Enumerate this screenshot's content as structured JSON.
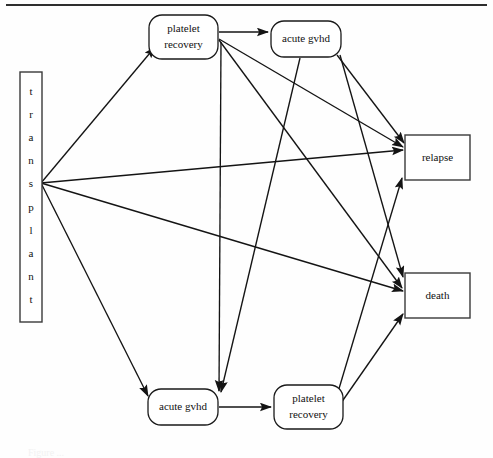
{
  "figure": {
    "type": "multistate-model-diagram",
    "top_rule": true,
    "caption_partial": "Figure ..."
  },
  "nodes": [
    {
      "id": "transplant",
      "label": "transplant",
      "letters": [
        "t",
        "r",
        "a",
        "n",
        "s",
        "p",
        "l",
        "a",
        "n",
        "t"
      ],
      "shape": "vertical-rectangle",
      "x": 20,
      "y": 72,
      "w": 22,
      "h": 250
    },
    {
      "id": "platelet-recovery-top",
      "label": "platelet recovery",
      "line1": "platelet",
      "line2": "recovery",
      "shape": "rounded-rectangle",
      "x": 149,
      "y": 15,
      "w": 69,
      "h": 44
    },
    {
      "id": "acute-gvhd-top",
      "label": "acute gvhd",
      "line1": "acute gvhd",
      "line2": "",
      "shape": "rounded-rectangle",
      "x": 271,
      "y": 21,
      "w": 70,
      "h": 36
    },
    {
      "id": "relapse",
      "label": "relapse",
      "line1": "relapse",
      "line2": "",
      "shape": "rectangle",
      "x": 405,
      "y": 135,
      "w": 65,
      "h": 45
    },
    {
      "id": "death",
      "label": "death",
      "line1": "death",
      "line2": "",
      "shape": "rectangle",
      "x": 405,
      "y": 273,
      "w": 65,
      "h": 45
    },
    {
      "id": "acute-gvhd-bottom",
      "label": "acute gvhd",
      "line1": "acute gvhd",
      "line2": "",
      "shape": "rounded-rectangle",
      "x": 148,
      "y": 389,
      "w": 70,
      "h": 36
    },
    {
      "id": "platelet-recovery-bottom",
      "label": "platelet recovery",
      "line1": "platelet",
      "line2": "recovery",
      "shape": "rounded-rectangle",
      "x": 274,
      "y": 385,
      "w": 69,
      "h": 44
    }
  ],
  "edges": [
    {
      "from": "transplant",
      "to": "platelet-recovery-top",
      "path": "M41,183 L155,47"
    },
    {
      "from": "transplant",
      "to": "relapse",
      "path": "M41,183 L403,150"
    },
    {
      "from": "transplant",
      "to": "death",
      "path": "M41,183 L403,291"
    },
    {
      "from": "transplant",
      "to": "acute-gvhd-bottom",
      "path": "M41,183 L148,396"
    },
    {
      "from": "platelet-recovery-top",
      "to": "acute-gvhd-top",
      "path": "M219,32 L268,32"
    },
    {
      "from": "platelet-recovery-top",
      "to": "relapse",
      "path": "M219,39 L403,147"
    },
    {
      "from": "platelet-recovery-top",
      "to": "death",
      "path": "M219,40 L402,288"
    },
    {
      "from": "acute-gvhd-top",
      "to": "relapse",
      "path": "M337,55 L404,143"
    },
    {
      "from": "acute-gvhd-top",
      "to": "death",
      "path": "M340,55 L403,277"
    },
    {
      "from": "acute-gvhd-bottom",
      "to": "platelet-recovery-bottom",
      "path": "M219,407 L271,407"
    },
    {
      "from": "platelet-recovery-bottom",
      "to": "relapse",
      "path": "M338,392 L402,178"
    },
    {
      "from": "platelet-recovery-bottom",
      "to": "death",
      "path": "M341,403 L403,314"
    },
    {
      "from": "platelet-recovery-top",
      "to": "acute-gvhd-bottom",
      "path": "M221,42 L219,391"
    },
    {
      "from": "acute-gvhd-top",
      "to": "acute-gvhd-bottom",
      "path": "M300,58 L221,392"
    }
  ],
  "colors": {
    "line": "#141414",
    "node_stroke": "#1a1a1a",
    "box_stroke": "#3a3a3a",
    "text": "#111111",
    "background": "#ffffff"
  }
}
